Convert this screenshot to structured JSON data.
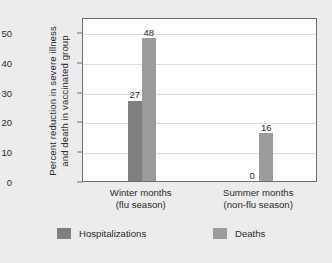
{
  "chart_data": {
    "type": "bar",
    "title": "",
    "xlabel": "",
    "ylabel_line1": "Percent reduction in severe illness",
    "ylabel_line2": "and death in vaccinated group",
    "ylim": [
      0,
      55
    ],
    "yticks": [
      0,
      10,
      20,
      30,
      40,
      50
    ],
    "ytick_labels": [
      "0",
      "10",
      "20",
      "30",
      "40",
      "50"
    ],
    "grid": true,
    "legend_position": "bottom",
    "categories": [
      {
        "line1": "Winter months",
        "line2": "(flu season)"
      },
      {
        "line1": "Summer months",
        "line2": "(non-flu season)"
      }
    ],
    "series": [
      {
        "name": "Hospitalizations",
        "color": "#808080",
        "values": [
          27,
          0
        ],
        "labels": [
          "27",
          "0"
        ]
      },
      {
        "name": "Deaths",
        "color": "#9b9b9b",
        "values": [
          48,
          16
        ],
        "labels": [
          "48",
          "16"
        ]
      }
    ]
  },
  "colors": {
    "figure_background": "#ececed",
    "plot_background": "#ffffff",
    "axis": "#6e6e6e",
    "gridline": "#dcdcdc",
    "text": "#2b2b2b",
    "hospitalizations": "#808080",
    "deaths": "#9b9b9b"
  }
}
